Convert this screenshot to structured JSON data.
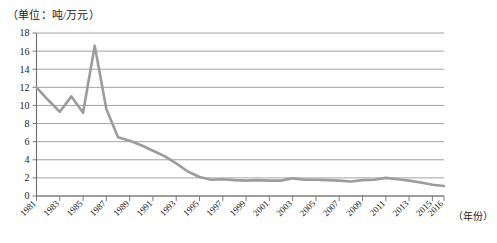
{
  "chart_data": {
    "type": "line",
    "title": "",
    "unit_note": "（单位：吨/万元）",
    "xlabel": "（年份）",
    "ylabel": "",
    "xlim": [
      1981,
      2016
    ],
    "ylim": [
      0,
      18
    ],
    "ytick_step": 2,
    "grid": true,
    "legend": "none",
    "line_color": "#9c9c9c",
    "grid_color": "#8c8c8c",
    "axis_color": "#6d6d6d",
    "yticks": [
      "0",
      "2",
      "4",
      "6",
      "8",
      "10",
      "12",
      "14",
      "16",
      "18"
    ],
    "xticks": [
      "1981",
      "1983",
      "1985",
      "1987",
      "1989",
      "1991",
      "1993",
      "1995",
      "1997",
      "1999",
      "2001",
      "2003",
      "2005",
      "2007",
      "2009",
      "2011",
      "2013",
      "2015",
      "2016"
    ],
    "x": [
      1981,
      1982,
      1983,
      1984,
      1985,
      1986,
      1987,
      1988,
      1989,
      1990,
      1991,
      1992,
      1993,
      1994,
      1995,
      1996,
      1997,
      1998,
      1999,
      2000,
      2001,
      2002,
      2003,
      2004,
      2005,
      2006,
      2007,
      2008,
      2009,
      2010,
      2011,
      2012,
      2013,
      2014,
      2015,
      2016
    ],
    "series": [
      {
        "name": "能耗强度",
        "values": [
          12.0,
          10.6,
          9.3,
          11.0,
          9.2,
          16.6,
          9.6,
          6.5,
          6.1,
          5.6,
          5.0,
          4.4,
          3.6,
          2.7,
          2.1,
          1.8,
          1.85,
          1.75,
          1.7,
          1.75,
          1.7,
          1.7,
          1.95,
          1.8,
          1.8,
          1.75,
          1.7,
          1.6,
          1.75,
          1.8,
          2.0,
          1.85,
          1.7,
          1.5,
          1.25,
          1.1
        ]
      }
    ]
  }
}
